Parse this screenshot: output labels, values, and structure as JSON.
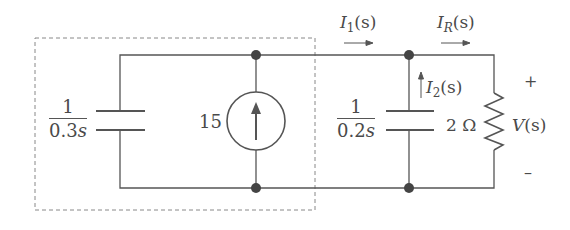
{
  "diagram": {
    "type": "circuit",
    "colors": {
      "wire": "#555555",
      "text": "#4a4a4a",
      "dashed_box": "#888888"
    },
    "components": {
      "left_capacitor": {
        "numerator": "1",
        "denominator": "0.3",
        "variable": "s"
      },
      "current_source": {
        "value": "15",
        "direction": "up"
      },
      "right_capacitor": {
        "numerator": "1",
        "denominator": "0.2",
        "variable": "s"
      },
      "resistor": {
        "value": "2 Ω"
      }
    },
    "currents": {
      "i1": {
        "symbol": "I",
        "sub": "1",
        "arg": "(s)"
      },
      "ir": {
        "symbol": "I",
        "sub": "R",
        "arg": "(s)"
      },
      "i2": {
        "symbol": "I",
        "sub": "2",
        "arg": "(s)"
      }
    },
    "voltage": {
      "symbol": "V",
      "arg": "(s)",
      "plus": "+",
      "minus": "–"
    }
  }
}
